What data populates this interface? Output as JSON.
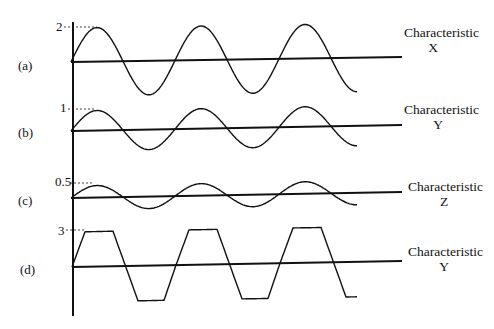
{
  "title": "",
  "panels": [
    {
      "label": "(a)",
      "peak_label": "2",
      "amplitude": 2,
      "waveform": "sine",
      "characteristic": [
        "Characteristic",
        "X"
      ]
    },
    {
      "label": "(b)",
      "peak_label": "1",
      "amplitude": 1,
      "waveform": "sine",
      "characteristic": [
        "Characteristic",
        "Y"
      ]
    },
    {
      "label": "(c)",
      "peak_label": "0.5",
      "amplitude": 0.5,
      "waveform": "sine",
      "characteristic": [
        "Characteristic",
        "Z"
      ]
    },
    {
      "label": "(d)",
      "peak_label": "3",
      "amplitude": 3,
      "waveform": "trapezoid",
      "characteristic": [
        "Characteristic",
        "Y"
      ]
    }
  ],
  "cycles_shown": 2.75,
  "colors": {
    "ink": "#111111",
    "background": "#ffffff"
  }
}
